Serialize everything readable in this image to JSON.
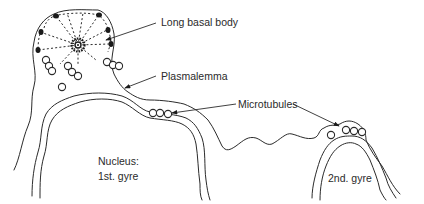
{
  "figure": {
    "labels": {
      "basal_body": "Long basal body",
      "plasmalemma": "Plasmalemma",
      "microtubules": "Microtubules",
      "nucleus_line1": "Nucleus:",
      "nucleus_line2": "1st. gyre",
      "second_gyre": "2nd. gyre"
    },
    "colors": {
      "line": "#2b2b2b",
      "background": "#ffffff"
    }
  }
}
